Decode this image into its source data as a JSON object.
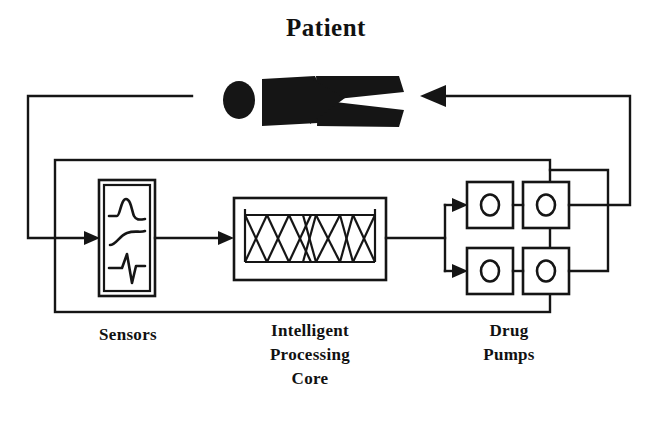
{
  "figure": {
    "title": "Patient",
    "background_color": "#ffffff",
    "ink_color": "#151515"
  },
  "labels": {
    "patient": "Patient",
    "sensors": "Sensors",
    "core_line1": "Intelligent",
    "core_line2": "Processing",
    "core_line3": "Core",
    "pumps_line1": "Drug",
    "pumps_line2": "Pumps"
  },
  "blocks": [
    {
      "id": "sensors",
      "name": "Sensors",
      "icon": "waveform-icon",
      "waveforms": [
        "pressure-bump-wave",
        "s-curve-wave",
        "ecg-spike-wave"
      ]
    },
    {
      "id": "intelligent-processing-core",
      "name": "Intelligent Processing Core",
      "icon": "neural-network-icon",
      "crossing_units": 6
    },
    {
      "id": "drug-pumps",
      "name": "Drug Pumps",
      "icon": "pump-icon",
      "pump_count": 4
    }
  ],
  "signal_flow": [
    {
      "from": "patient",
      "to": "sensors",
      "arrow": true
    },
    {
      "from": "sensors",
      "to": "intelligent-processing-core",
      "arrow": true
    },
    {
      "from": "intelligent-processing-core",
      "to": "drug-pumps-upper",
      "arrow": true
    },
    {
      "from": "intelligent-processing-core",
      "to": "drug-pumps-lower",
      "arrow": true
    },
    {
      "from": "drug-pumps",
      "to": "patient",
      "arrow": true
    }
  ]
}
